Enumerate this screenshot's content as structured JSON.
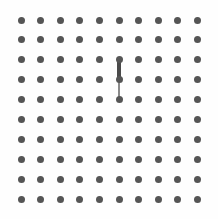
{
  "board": {
    "title": "Dot Grid Board",
    "width": 218,
    "height": 219,
    "background_color": "#fefefe",
    "rows": 10,
    "cols": 10,
    "origin_x": 21,
    "origin_y": 20,
    "spacing_x": 19.6,
    "spacing_y": 19.9,
    "dot": {
      "label": "grid-dot",
      "diameter": 7,
      "color": "#555555"
    },
    "edges": [
      {
        "label": "connector-segment-upper",
        "orientation": "vertical",
        "col": 5,
        "row_start": 2,
        "row_end": 3,
        "thickness": 4,
        "color": "#4a4a4a"
      },
      {
        "label": "connector-segment-lower",
        "orientation": "vertical",
        "col": 5,
        "row_start": 3,
        "row_end": 4,
        "thickness": 2,
        "color": "#8a8a8a"
      }
    ]
  }
}
